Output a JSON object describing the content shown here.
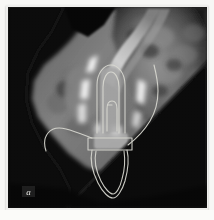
{
  "figure": {
    "panel_label": "a",
    "modality": "CBCT cross-sectional slice",
    "label_position": "bottom-left"
  },
  "canvas": {
    "width": 199,
    "height": 201,
    "background_color": "#040404",
    "plate_color": "#f7f7f5",
    "border_color": "#eeeeec"
  },
  "palette": {
    "background": "#040404",
    "bone_mid": "#6f6f6f",
    "bone_bright": "#bdbdbd",
    "metal_artifact": "#ffffff",
    "contour_line": "#d8d8d0",
    "label_text": "#e9e9e6",
    "soft_tissue": "#2a2a2a"
  },
  "contours": {
    "implant_outer": "implant outer segmentation outline",
    "implant_inner": "implant inner segmentation outline",
    "abutment_band": "abutment / crown horizontal band contour",
    "root_outline": "adjacent tooth root outline",
    "canal_left": "left mandibular canal trace",
    "canal_right": "right cortical boundary trace"
  },
  "regions": {
    "alveolar_ridge": "alveolar bone mass, upper-left to center",
    "cortical_plate": "bright cortical plate band running upper-right",
    "streak_artifact": "bright metal streak artifacts flanking implant",
    "diagonal_cutoff": "black diagonal field-of-view cutoff, lower-right"
  }
}
